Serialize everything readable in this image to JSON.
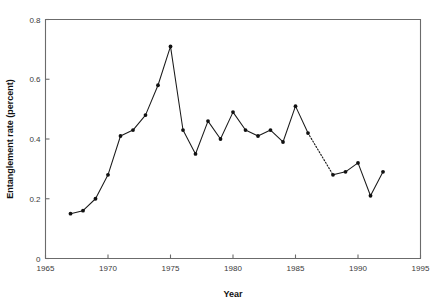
{
  "chart_data": {
    "type": "line",
    "title": "",
    "xlabel": "Year",
    "ylabel": "Entanglement rate (percent)",
    "xlim": [
      1965,
      1995
    ],
    "ylim": [
      0,
      0.8
    ],
    "grid": false,
    "legend": null,
    "xticks": [
      1965,
      1970,
      1975,
      1980,
      1985,
      1990,
      1995
    ],
    "xtick_labels": [
      "1965",
      "1970",
      "1975",
      "1980",
      "1985",
      "1990",
      "1995"
    ],
    "yticks": [
      0,
      0.2,
      0.4,
      0.6,
      0.8
    ],
    "ytick_labels": [
      "0",
      "0.2",
      "0.4",
      "0.6",
      "0.8"
    ],
    "x": [
      1967,
      1968,
      1969,
      1970,
      1971,
      1972,
      1973,
      1974,
      1975,
      1976,
      1977,
      1978,
      1979,
      1980,
      1981,
      1982,
      1983,
      1984,
      1985,
      1986,
      1988,
      1989,
      1990,
      1991,
      1992
    ],
    "values": [
      0.15,
      0.16,
      0.2,
      0.28,
      0.41,
      0.43,
      0.48,
      0.58,
      0.71,
      0.43,
      0.35,
      0.46,
      0.4,
      0.49,
      0.43,
      0.41,
      0.43,
      0.39,
      0.51,
      0.42,
      0.28,
      0.29,
      0.32,
      0.21,
      0.29
    ],
    "series": [
      {
        "name": "Entanglement rate",
        "x": [
          1967,
          1968,
          1969,
          1970,
          1971,
          1972,
          1973,
          1974,
          1975,
          1976,
          1977,
          1978,
          1979,
          1980,
          1981,
          1982,
          1983,
          1984,
          1985,
          1986,
          1988,
          1989,
          1990,
          1991,
          1992
        ],
        "values": [
          0.15,
          0.16,
          0.2,
          0.28,
          0.41,
          0.43,
          0.48,
          0.58,
          0.71,
          0.43,
          0.35,
          0.46,
          0.4,
          0.49,
          0.43,
          0.41,
          0.43,
          0.39,
          0.51,
          0.42,
          0.28,
          0.29,
          0.32,
          0.21,
          0.29
        ]
      }
    ],
    "segments": [
      {
        "style": "solid",
        "x": [
          1967,
          1968,
          1969,
          1970,
          1971,
          1972,
          1973,
          1974,
          1975,
          1976,
          1977,
          1978,
          1979,
          1980,
          1981,
          1982,
          1983,
          1984,
          1985,
          1986
        ],
        "values": [
          0.15,
          0.16,
          0.2,
          0.28,
          0.41,
          0.43,
          0.48,
          0.58,
          0.71,
          0.43,
          0.35,
          0.46,
          0.4,
          0.49,
          0.43,
          0.41,
          0.43,
          0.39,
          0.51,
          0.42
        ]
      },
      {
        "style": "dotted",
        "x": [
          1986,
          1988
        ],
        "values": [
          0.42,
          0.28
        ]
      },
      {
        "style": "solid",
        "x": [
          1988,
          1989,
          1990,
          1991,
          1992
        ],
        "values": [
          0.28,
          0.29,
          0.32,
          0.21,
          0.29
        ]
      }
    ],
    "colors": {
      "line": "#1a1a1a",
      "marker": "#111111",
      "axis": "#6b6b6b",
      "background": "#ffffff",
      "text": "#3a3a3a"
    }
  }
}
